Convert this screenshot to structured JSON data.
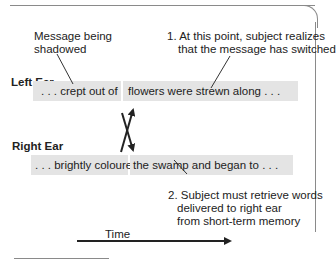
{
  "annotations": {
    "shadowed": [
      "Message being",
      "shadowed"
    ],
    "note1": [
      "1. At this point, subject realizes",
      "that the message has switched"
    ],
    "note2": [
      "2. Subject must retrieve words",
      "delivered to right ear",
      "from short-term memory"
    ]
  },
  "left_ear": {
    "label": "Left Ear",
    "before": ". . . crept out of",
    "after": "flowers were strewn along . . ."
  },
  "right_ear": {
    "label": "Right Ear",
    "before": ". . . brightly coloured",
    "after": "the swamp and began to . . ."
  },
  "time_axis": {
    "label": "Time"
  },
  "colors": {
    "box": "#e4e4e4",
    "line": "#222222",
    "frame": "#8a8a8a"
  }
}
